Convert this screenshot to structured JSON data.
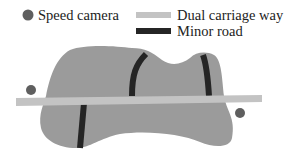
{
  "legend": {
    "items": [
      {
        "label": "Speed camera",
        "symbol": "circle",
        "color": "#5f5f5f"
      },
      {
        "label": "Dual carriage way",
        "symbol": "light-bar",
        "color": "#c3c3c3"
      },
      {
        "label": "Minor road",
        "symbol": "dark-bar",
        "color": "#252525"
      }
    ]
  },
  "map": {
    "area_color": "#9b9b9b",
    "speed_cameras": [
      {
        "name": "left",
        "cx": 31,
        "cy": 90
      },
      {
        "name": "right",
        "cx": 240,
        "cy": 113
      }
    ],
    "dual_carriageway_count": 1,
    "minor_road_count": 3
  }
}
